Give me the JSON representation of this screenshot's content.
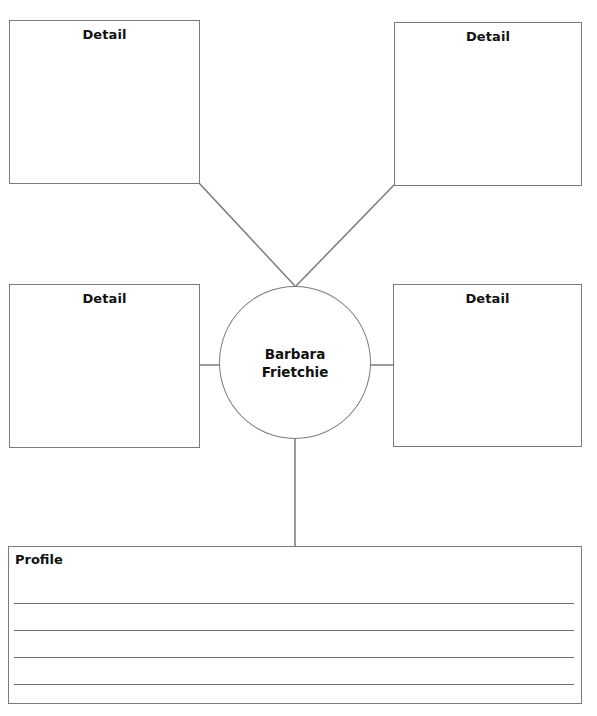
{
  "diagram": {
    "type": "character web organizer",
    "center": {
      "label_lines": [
        "Barbara",
        "Frietchie"
      ]
    },
    "detail_boxes": [
      {
        "position": "top-left",
        "label": "Detail"
      },
      {
        "position": "top-right",
        "label": "Detail"
      },
      {
        "position": "middle-left",
        "label": "Detail"
      },
      {
        "position": "middle-right",
        "label": "Detail"
      }
    ],
    "profile": {
      "label": "Profile",
      "writing_lines": 4
    },
    "colors": {
      "stroke": "#7a7a7a",
      "text": "#111111",
      "background": "#ffffff"
    }
  }
}
